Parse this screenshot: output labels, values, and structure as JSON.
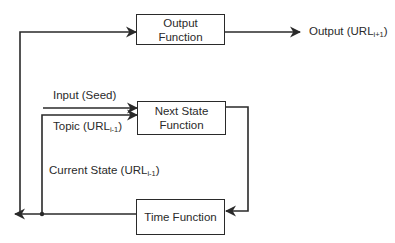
{
  "diagram": {
    "type": "block-diagram",
    "boxes": {
      "output_function": {
        "line1": "Output",
        "line2": "Function"
      },
      "next_state_function": {
        "line1": "Next State",
        "line2": "Function"
      },
      "time_function": {
        "line1": "Time Function"
      }
    },
    "labels": {
      "output": {
        "text": "Output (URL",
        "sub": "i+1",
        "close": ")"
      },
      "input": {
        "text": "Input (Seed)"
      },
      "topic": {
        "text": "Topic (URL",
        "sub": "i-1",
        "close": ")"
      },
      "current_state": {
        "text": "Current State (URL",
        "sub": "i-1",
        "close": ")"
      }
    },
    "colors": {
      "stroke": "#2a2a2a",
      "background": "#ffffff"
    }
  }
}
